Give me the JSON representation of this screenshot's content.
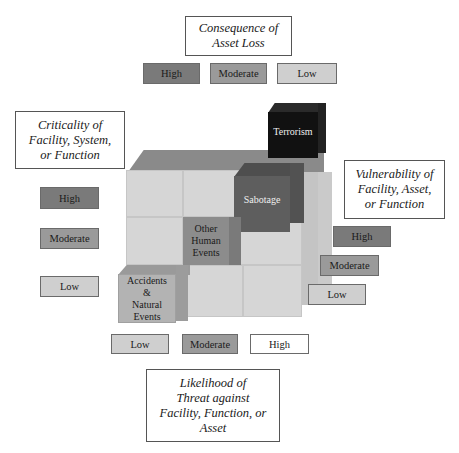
{
  "diagram": {
    "type": "3d-risk-cube",
    "axes": {
      "consequence": {
        "title": "Consequence of Asset Loss",
        "title_lines": [
          "Consequence of",
          "Asset Loss"
        ],
        "levels": [
          "High",
          "Moderate",
          "Low"
        ]
      },
      "criticality": {
        "title": "Criticality of Facility, System, or Function",
        "title_lines": [
          "Criticality of",
          "Facility, System,",
          "or Function"
        ],
        "levels": [
          "High",
          "Moderate",
          "Low"
        ]
      },
      "vulnerability": {
        "title": "Vulnerability of Facility, Asset, or Function",
        "title_lines": [
          "Vulnerability of",
          "Facility, Asset,",
          "or Function"
        ],
        "levels": [
          "High",
          "Moderate",
          "Low"
        ]
      },
      "likelihood": {
        "title": "Likelihood of Threat against Facility, Function, or Asset",
        "title_lines": [
          "Likelihood of",
          "Threat against",
          "Facility, Function, or",
          "Asset"
        ],
        "levels": [
          "Low",
          "Moderate",
          "High"
        ]
      }
    },
    "threat_cubes": [
      {
        "label": "Terrorism",
        "lines": [
          "Terrorism"
        ],
        "shade": "#111111"
      },
      {
        "label": "Sabotage",
        "lines": [
          "Sabotage"
        ],
        "shade": "#5e5e5e"
      },
      {
        "label": "Other Human Events",
        "lines": [
          "Other",
          "Human",
          "Events"
        ],
        "shade": "#8c8c8c"
      },
      {
        "label": "Accidents & Natural Events",
        "lines": [
          "Accidents",
          "&",
          "Natural",
          "Events"
        ],
        "shade": "#b3b3b3"
      }
    ],
    "colors": {
      "high": "#7a7a7a",
      "moderate": "#9a9a9a",
      "low": "#cfcfcf",
      "cube_front": "#d6d6d6",
      "cube_top": "#8a8a8a"
    }
  }
}
